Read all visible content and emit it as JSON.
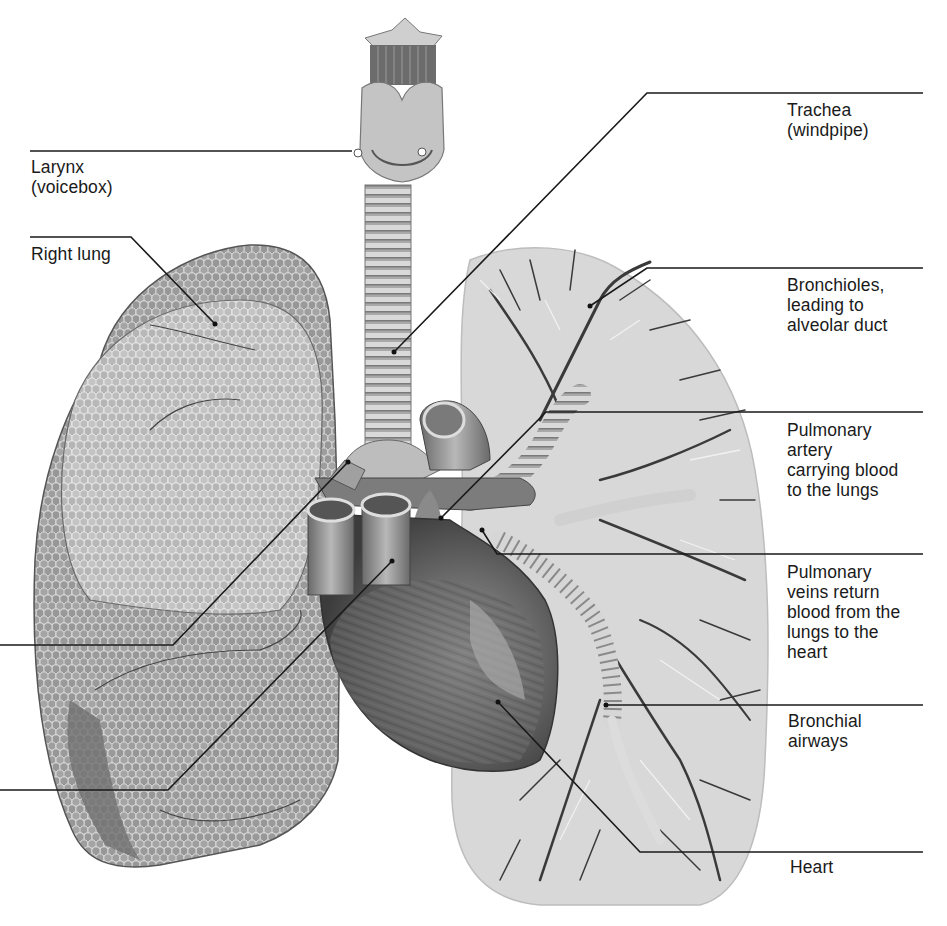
{
  "diagram": {
    "colors": {
      "background": "#ffffff",
      "leader_line": "#1a1a1a",
      "lung_tissue": "#8a8a8a",
      "lung_tissue_light": "#b8b8b8",
      "left_lung_fill": "#d6d6d6",
      "heart": "#6e6e6e",
      "airway": "#cfcfcf",
      "vessel": "#3a3a3a"
    },
    "labels": [
      {
        "id": "larynx",
        "text": "Larynx\n(voicebox)",
        "side": "left",
        "line_y": 151,
        "target": [
          352,
          151
        ]
      },
      {
        "id": "right-lung",
        "text": "Right lung",
        "side": "left",
        "line_y": 237,
        "target": [
          215,
          324
        ]
      },
      {
        "id": "trachea",
        "text": "Trachea\n(windpipe)",
        "side": "right",
        "line_y": 93,
        "target": [
          394,
          352
        ]
      },
      {
        "id": "bronchioles",
        "text": "Bronchioles,\nleading to\nalveolar duct",
        "side": "right",
        "line_y": 268,
        "target": [
          590,
          306
        ]
      },
      {
        "id": "pulmonary-artery",
        "text": "Pulmonary\nartery\ncarrying blood\nto the lungs",
        "side": "right",
        "line_y": 412,
        "target": [
          441,
          518
        ]
      },
      {
        "id": "pulmonary-veins",
        "text": "Pulmonary\nveins return\nblood from the\nlungs to the\nheart",
        "side": "right",
        "line_y": 554,
        "target": [
          482,
          530
        ]
      },
      {
        "id": "bronchial-airways",
        "text": "Bronchial\nairways",
        "side": "right",
        "line_y": 705,
        "target": [
          606,
          705
        ]
      },
      {
        "id": "heart",
        "text": "Heart",
        "side": "right",
        "line_y": 852,
        "target": [
          498,
          702
        ]
      }
    ],
    "unlabeled_leaders": [
      {
        "id": "left-leader-upper",
        "line_y": 645,
        "target": [
          348,
          462
        ]
      },
      {
        "id": "left-leader-lower",
        "line_y": 790,
        "target": [
          392,
          561
        ]
      }
    ]
  }
}
